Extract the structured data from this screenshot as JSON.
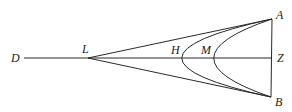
{
  "diagram": {
    "type": "geometric-figure",
    "points": {
      "D": "D",
      "L": "L",
      "H": "H",
      "M": "M",
      "A": "A",
      "Z": "Z",
      "B": "B"
    },
    "segments": [
      "DZ",
      "LA",
      "LB",
      "AB"
    ],
    "curves": [
      "arc AHB",
      "arc AMB"
    ]
  }
}
